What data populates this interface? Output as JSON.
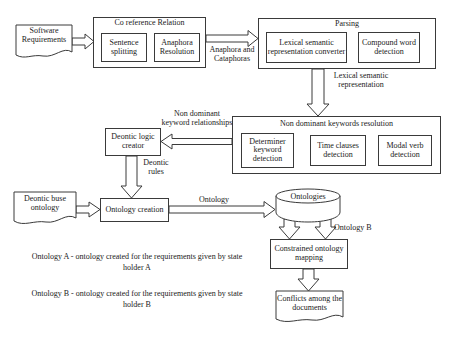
{
  "diagram": {
    "nodes": {
      "software_requirements": "Software Requirements",
      "coref_group": "Co reference Relation",
      "sentence_splitting": "Sentence splitting",
      "anaphora_resolution": "Anaphora Resolution",
      "parsing_group": "Parsing",
      "lexical_semantic_converter": "Lexical semantic representation converter",
      "compound_word_detection": "Compound word detection",
      "nondominant_group": "Non dominant keywords resolution",
      "determiner_keyword_detection": "Determiner keyword detection",
      "time_clauses_detection": "Time clauses detection",
      "modal_verb_detection": "Modal verb detection",
      "deontic_logic_creator": "Deontic logic creator",
      "deontic_base_ontology": "Deontic buse ontology",
      "ontology_creation": "Ontology creation",
      "ontologies_store": "Ontologies",
      "constrained_ontology_mapping": "Constrained ontology mapping",
      "conflicts_among_documents": "Conflicts among the documents"
    },
    "edge_labels": {
      "anaphora_and_cataphoras": "Anaphora and Cataphoras",
      "lexical_semantic_representation": "Lexical semantic representation",
      "non_dominant_keyword_relationships": "Non dominant keyword relationships",
      "deontic_rules": "Deontic rules",
      "ontology": "Ontology",
      "ontology_b": "Ontology B"
    },
    "captions": [
      "Ontology A - ontology created for the requirements given by state holder A",
      "Ontology B - ontology created for the requirements given by state holder B"
    ],
    "colors": {
      "stroke": "#3a3a3a",
      "text": "#1a1a1a",
      "background": "#ffffff"
    }
  }
}
